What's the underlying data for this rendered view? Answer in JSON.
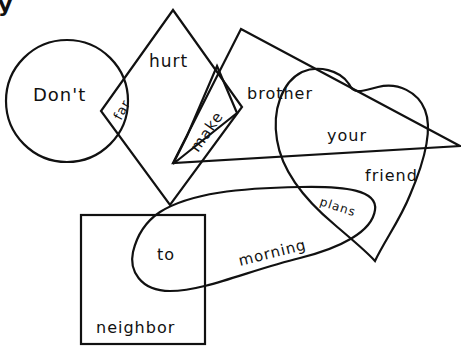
{
  "diagram": {
    "type": "word-shapes-puzzle",
    "corner_fragment": "y",
    "shapes": [
      {
        "id": "circle",
        "kind": "circle",
        "words": [
          "Don't"
        ]
      },
      {
        "id": "diamond",
        "kind": "diamond",
        "words": [
          "hurt"
        ]
      },
      {
        "id": "triangle",
        "kind": "triangle",
        "words": [
          "brother"
        ]
      },
      {
        "id": "heart",
        "kind": "heart",
        "words": [
          "your",
          "friend"
        ]
      },
      {
        "id": "oval",
        "kind": "oval",
        "words": [
          "morning"
        ]
      },
      {
        "id": "square",
        "kind": "square",
        "words": [
          "neighbor"
        ]
      },
      {
        "id": "rectangle",
        "kind": "rotated-rectangle",
        "words": [
          "make"
        ]
      }
    ],
    "intersections": [
      {
        "shapes": [
          "circle",
          "diamond"
        ],
        "word": "far"
      },
      {
        "shapes": [
          "heart",
          "oval"
        ],
        "word": "plans"
      },
      {
        "shapes": [
          "square",
          "oval"
        ],
        "word": "to"
      }
    ],
    "labels": {
      "dont": "Don't",
      "far": "far",
      "hurt": "hurt",
      "make": "make",
      "brother": "brother",
      "your": "your",
      "friend": "friend",
      "plans": "plans",
      "to": "to",
      "morning": "morning",
      "neighbor": "neighbor"
    },
    "stroke_color": "#111111",
    "background_color": "#ffffff"
  }
}
